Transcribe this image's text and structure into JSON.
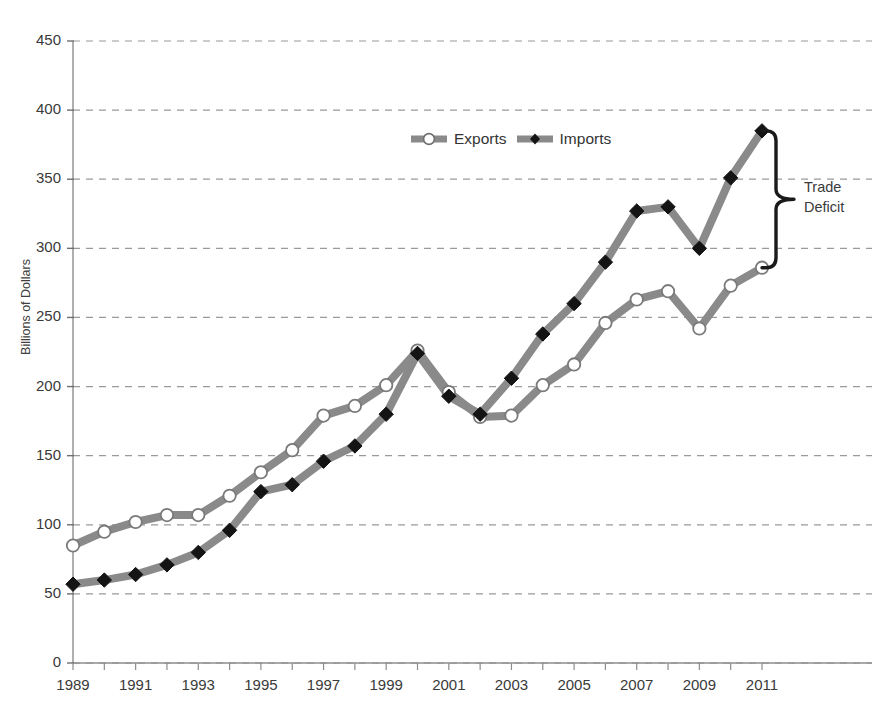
{
  "page": {
    "header_fragment": "",
    "page_number": ""
  },
  "chart_data": {
    "type": "line",
    "title": "",
    "xlabel": "",
    "ylabel": "Billions of Dollars",
    "ylim": [
      0,
      450
    ],
    "ytick_step": 50,
    "yticks": [
      0,
      50,
      100,
      150,
      200,
      250,
      300,
      350,
      400,
      450
    ],
    "xlim": [
      1989,
      2011
    ],
    "x": [
      1989,
      1990,
      1991,
      1992,
      1993,
      1994,
      1995,
      1996,
      1997,
      1998,
      1999,
      2000,
      2001,
      2002,
      2003,
      2004,
      2005,
      2006,
      2007,
      2008,
      2009,
      2010,
      2011
    ],
    "xticks": [
      1989,
      1991,
      1993,
      1995,
      1997,
      1999,
      2001,
      2003,
      2005,
      2007,
      2009,
      2011
    ],
    "xtick_labels": [
      "1989",
      "1991",
      "1993",
      "1995",
      "1997",
      "1999",
      "2001",
      "2003",
      "2005",
      "2007",
      "2009",
      "2011"
    ],
    "grid": "horizontal-dashed",
    "legend_position": "top-center",
    "series": [
      {
        "name": "Exports",
        "marker": "circle-open",
        "color": "#8a8a8a",
        "marker_fill": "#ffffff",
        "marker_edge": "#7a7a7a",
        "values": [
          85,
          95,
          102,
          107,
          107,
          121,
          138,
          154,
          179,
          186,
          201,
          226,
          196,
          178,
          179,
          201,
          216,
          246,
          263,
          269,
          242,
          273,
          286
        ]
      },
      {
        "name": "Imports",
        "marker": "diamond-filled",
        "color": "#8a8a8a",
        "marker_fill": "#141414",
        "marker_edge": "#141414",
        "values": [
          57,
          60,
          64,
          71,
          80,
          96,
          124,
          129,
          146,
          157,
          180,
          224,
          193,
          180,
          206,
          238,
          260,
          290,
          327,
          330,
          300,
          351,
          385
        ]
      }
    ],
    "annotations": [
      {
        "name": "trade-deficit-brace",
        "label": "Trade\nDeficit",
        "label_line1": "Trade",
        "label_line2": "Deficit",
        "spans_from": 385,
        "spans_to": 286,
        "at_x": 2011
      }
    ]
  }
}
